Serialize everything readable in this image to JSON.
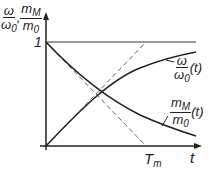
{
  "axes": {
    "y_label": {
      "num1": "ω",
      "den1": "ω",
      "den1_sub": "0",
      "sep": ",",
      "num2": "m",
      "num2_sub": "M",
      "den2": "m",
      "den2_sub": "0"
    },
    "y_tick_1": "1",
    "x_label": "t",
    "x_tick_Tm": {
      "main": "T",
      "sub": "m"
    }
  },
  "curves": {
    "omega": {
      "num": "ω",
      "den": "ω",
      "den_sub": "0",
      "arg": "(t)"
    },
    "mM": {
      "num": "m",
      "num_sub": "M",
      "den": "m",
      "den_sub": "0",
      "arg": "(t)"
    }
  },
  "colors": {
    "curve": "#222222",
    "reference": "#777777"
  }
}
